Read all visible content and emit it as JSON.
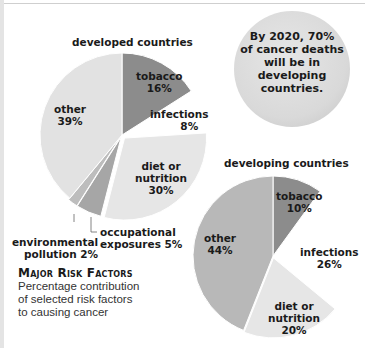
{
  "callout": {
    "lines": [
      "By 2020, 70%",
      "of cancer deaths",
      "will be in",
      "developing",
      "countries."
    ]
  },
  "caption": {
    "heading": "Major Risk Factors",
    "description_lines": [
      "Percentage contribution",
      "of selected risk factors",
      "to causing cancer"
    ]
  },
  "colors": {
    "tobacco": "#8c8c8c",
    "infections": "#ffffff",
    "diet": "#e6e6e6",
    "occupational": "#a6a6a6",
    "environmental": "#bdbdbd",
    "other_developed": "#e2e2e2",
    "other_developing": "#b8b8b8",
    "callout_fill": "#dedede"
  },
  "chart_data": [
    {
      "type": "pie",
      "title": "developed countries",
      "categories": [
        "tobacco",
        "infections",
        "diet or nutrition",
        "occupational exposures",
        "environmental pollution",
        "other"
      ],
      "values": [
        16,
        8,
        30,
        5,
        2,
        39
      ],
      "labels": {
        "tobacco": [
          "tobacco",
          "16%"
        ],
        "infections": [
          "infections",
          "8%"
        ],
        "diet": [
          "diet or",
          "nutrition",
          "30%"
        ],
        "occupational": [
          "occupational",
          "exposures 5%"
        ],
        "environmental": [
          "environmental",
          "pollution 2%"
        ],
        "other": [
          "other",
          "39%"
        ]
      }
    },
    {
      "type": "pie",
      "title": "developing countries",
      "categories": [
        "tobacco",
        "infections",
        "diet or nutrition",
        "other"
      ],
      "values": [
        10,
        26,
        20,
        44
      ],
      "labels": {
        "tobacco": [
          "tobacco",
          "10%"
        ],
        "infections": [
          "infections",
          "26%"
        ],
        "diet": [
          "diet or",
          "nutrition",
          "20%"
        ],
        "other": [
          "other",
          "44%"
        ]
      }
    }
  ]
}
